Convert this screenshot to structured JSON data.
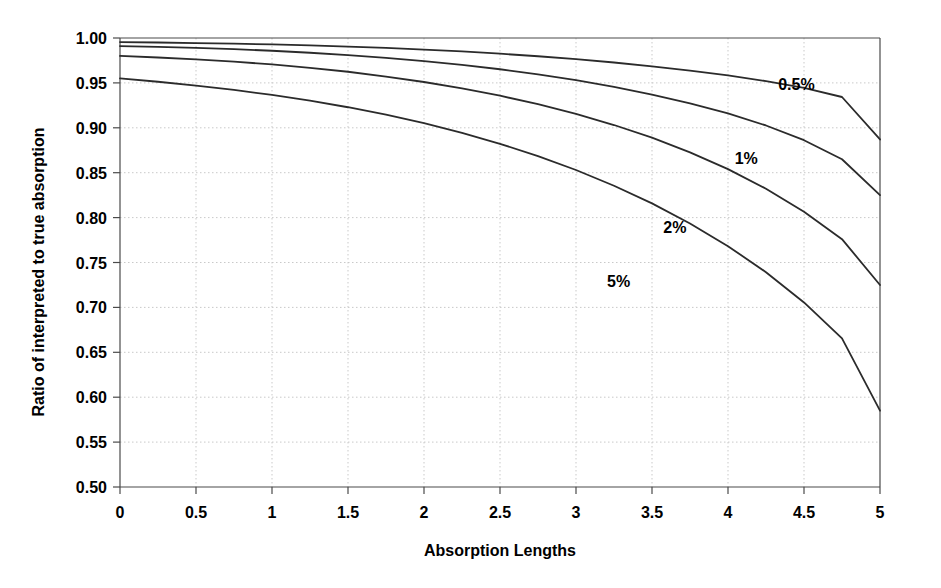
{
  "chart_data": {
    "type": "line",
    "title": "",
    "xlabel": "Absorption Lengths",
    "ylabel": "Ratio of interpreted to true absorption",
    "xlim": [
      0,
      5
    ],
    "ylim": [
      0.5,
      1.0
    ],
    "xticks": [
      0,
      0.5,
      1,
      1.5,
      2,
      2.5,
      3,
      3.5,
      4,
      4.5,
      5
    ],
    "xticklabels": [
      "0",
      "0.5",
      "1",
      "1.5",
      "2",
      "2.5",
      "3",
      "3.5",
      "4",
      "4.5",
      "5"
    ],
    "yticks": [
      0.5,
      0.55,
      0.6,
      0.65,
      0.7,
      0.75,
      0.8,
      0.85,
      0.9,
      0.95,
      1.0
    ],
    "yticklabels": [
      "0.50",
      "0.55",
      "0.60",
      "0.65",
      "0.70",
      "0.75",
      "0.80",
      "0.85",
      "0.90",
      "0.95",
      "1.00"
    ],
    "grid": true,
    "legend_position": "inline-annotations",
    "x": [
      0,
      0.25,
      0.5,
      0.75,
      1,
      1.25,
      1.5,
      1.75,
      2,
      2.25,
      2.5,
      2.75,
      3,
      3.25,
      3.5,
      3.75,
      4,
      4.25,
      4.5,
      4.75,
      5
    ],
    "series": [
      {
        "name": "0.5%",
        "label": "0.5%",
        "color": "#2b2b2b",
        "label_x": 4.45,
        "label_y": 0.942,
        "values": [
          0.9955,
          0.995,
          0.9944,
          0.9937,
          0.9928,
          0.9917,
          0.9904,
          0.9889,
          0.9871,
          0.985,
          0.9825,
          0.9797,
          0.9764,
          0.9727,
          0.9685,
          0.9637,
          0.9583,
          0.952,
          0.9444,
          0.9343,
          0.887
        ]
      },
      {
        "name": "1%",
        "label": "1%",
        "color": "#2b2b2b",
        "label_x": 4.12,
        "label_y": 0.86,
        "values": [
          0.991,
          0.9901,
          0.989,
          0.9876,
          0.9858,
          0.9836,
          0.981,
          0.9779,
          0.9743,
          0.9701,
          0.9652,
          0.9595,
          0.953,
          0.9455,
          0.937,
          0.9272,
          0.916,
          0.9026,
          0.8862,
          0.865,
          0.825
        ]
      },
      {
        "name": "2%",
        "label": "2%",
        "color": "#2b2b2b",
        "label_x": 3.65,
        "label_y": 0.783,
        "values": [
          0.98,
          0.9783,
          0.9762,
          0.9737,
          0.9706,
          0.9668,
          0.9624,
          0.9571,
          0.951,
          0.9439,
          0.9357,
          0.9263,
          0.9155,
          0.9031,
          0.889,
          0.8727,
          0.854,
          0.8322,
          0.8066,
          0.776,
          0.725
        ]
      },
      {
        "name": "5%",
        "label": "5%",
        "color": "#2b2b2b",
        "label_x": 3.28,
        "label_y": 0.723,
        "values": [
          0.955,
          0.9513,
          0.947,
          0.9422,
          0.9366,
          0.9302,
          0.9229,
          0.9146,
          0.9051,
          0.8944,
          0.8822,
          0.8685,
          0.853,
          0.8355,
          0.8158,
          0.7935,
          0.7682,
          0.7392,
          0.7055,
          0.6655,
          0.585
        ]
      }
    ]
  }
}
